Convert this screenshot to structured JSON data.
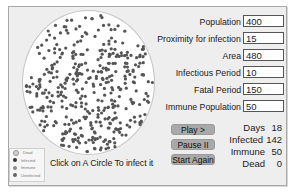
{
  "simulation": {
    "instruction": "Click on A Circle To infect it",
    "arena": {
      "shape": "circle",
      "dot_count": 400,
      "dot_color": "#555555"
    }
  },
  "parameters": [
    {
      "label": "Population",
      "value": "400"
    },
    {
      "label": "Proximity for infection",
      "value": "15"
    },
    {
      "label": "Area",
      "value": "480"
    },
    {
      "label": "Infectious Period",
      "value": "10"
    },
    {
      "label": "Fatal Period",
      "value": "150"
    },
    {
      "label": "Immune Population",
      "value": "50"
    }
  ],
  "buttons": {
    "play": "Play >",
    "pause": "Pause II",
    "restart": "Start Again"
  },
  "stats": [
    {
      "label": "Days",
      "value": "18"
    },
    {
      "label": "Infected",
      "value": "142"
    },
    {
      "label": "Immune",
      "value": "50"
    },
    {
      "label": "Dead",
      "value": "0"
    }
  ],
  "legend": [
    {
      "label": "Dead",
      "color": "#d0d0d0"
    },
    {
      "label": "Infected",
      "color": "#333333"
    },
    {
      "label": "Immune",
      "color": "#8a8a8a"
    },
    {
      "label": "Uninfected",
      "color": "#666666"
    }
  ],
  "colors": {
    "panel": "#eeeeee",
    "button": "#a9a9a9",
    "dot": "#555555"
  }
}
